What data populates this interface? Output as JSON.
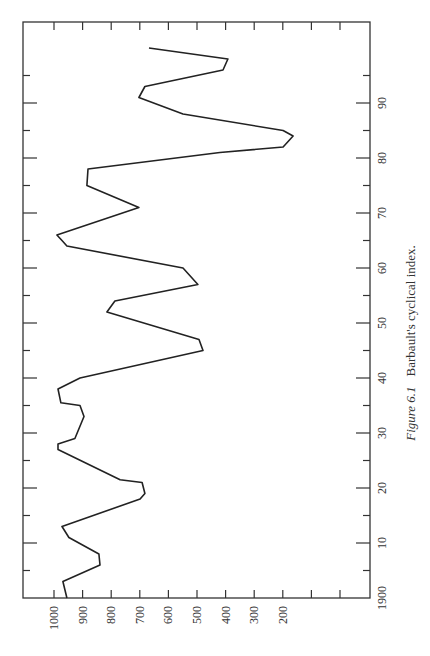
{
  "chart_data": {
    "type": "line",
    "orientation": "rotated-90-ccw",
    "title": "Barbault's cyclical index.",
    "figure_label": "Figure 6.1",
    "xlabel": "",
    "ylabel": "",
    "x_axis": {
      "label": "Year",
      "range": [
        1900,
        2000
      ],
      "tick_labels": [
        "1900",
        "10",
        "20",
        "30",
        "40",
        "50",
        "60",
        "70",
        "80",
        "90"
      ],
      "tick_values": [
        1900,
        1910,
        1920,
        1930,
        1940,
        1950,
        1960,
        1970,
        1980,
        1990
      ],
      "minor_tick_step": 5
    },
    "y_axis": {
      "label": "Index",
      "range": [
        0,
        1100
      ],
      "tick_labels": [
        "1000",
        "900",
        "800",
        "700",
        "600",
        "500",
        "400",
        "300",
        "200"
      ],
      "tick_values": [
        1000,
        900,
        800,
        700,
        600,
        500,
        400,
        300,
        200
      ],
      "extra_unlabeled_ticks": 2
    },
    "grid": false,
    "legend": null,
    "series": [
      {
        "name": "Barbault's cyclical index",
        "x": [
          1900,
          1903,
          1906,
          1908,
          1911,
          1913,
          1918,
          1919,
          1921,
          1921.5,
          1927,
          1928,
          1929,
          1933,
          1935,
          1935.5,
          1938,
          1940,
          1945,
          1947,
          1952,
          1954,
          1957,
          1960,
          1964,
          1965,
          1966,
          1971,
          1975,
          1978,
          1981,
          1982,
          1984,
          1985,
          1988,
          1991,
          1993,
          1996,
          1998,
          2000
        ],
        "values": [
          955,
          969,
          839,
          843,
          948,
          972,
          699,
          682,
          692,
          769,
          986,
          986,
          927,
          895,
          909,
          976,
          986,
          909,
          479,
          493,
          815,
          787,
          497,
          549,
          955,
          972,
          990,
          703,
          885,
          881,
          420,
          199,
          164,
          199,
          549,
          703,
          682,
          409,
          392,
          668
        ]
      }
    ]
  },
  "caption": {
    "figure_label": "Figure 6.1",
    "text": "Barbault's cyclical index."
  }
}
